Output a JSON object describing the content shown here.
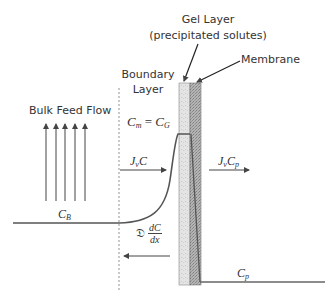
{
  "labels": {
    "gel_layer_title": "Gel Layer",
    "gel_layer_subtitle": "(precipitated solutes)",
    "membrane": "Membrane",
    "boundary_line1": "Boundary",
    "boundary_line2": "Layer",
    "bulk_feed_flow": "Bulk Feed Flow"
  },
  "math": {
    "cm_eq_cg": {
      "lhs": "C",
      "lhs_sub": "m",
      "eq": " = ",
      "rhs": "C",
      "rhs_sub": "G"
    },
    "jv_c": {
      "j": "J",
      "j_sub": "v",
      "c": "C"
    },
    "jv_cp": {
      "j": "J",
      "j_sub": "v",
      "c": "C",
      "c_sub": "p"
    },
    "cb": {
      "c": "C",
      "c_sub": "B"
    },
    "cp": {
      "c": "C",
      "c_sub": "p"
    },
    "diffusion": {
      "coef": "𝔇",
      "num": "dC",
      "den": "dx"
    }
  },
  "colors": {
    "line": "#555555",
    "gel": "#d9d9d9",
    "membrane": "#a8a8a8",
    "text": "#333333"
  }
}
